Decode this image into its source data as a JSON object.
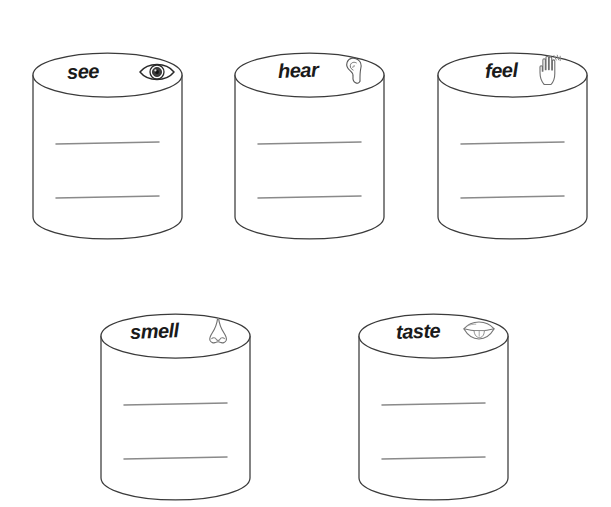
{
  "page": {
    "background_color": "#ffffff",
    "outline_color": "#3a3a3a",
    "writing_line_color": "#8a8a8a",
    "label_color": "#1a1a1a"
  },
  "jars": [
    {
      "id": "see",
      "label": "see",
      "icon": "eye-icon",
      "x": 32,
      "y": 52,
      "width": 151,
      "height": 188,
      "label_x": 35,
      "label_y": 10,
      "icon_x": 106,
      "icon_y": 8,
      "writing_lines": 2
    },
    {
      "id": "hear",
      "label": "hear",
      "icon": "ear-icon",
      "x": 234,
      "y": 52,
      "width": 151,
      "height": 188,
      "label_x": 44,
      "label_y": 9,
      "icon_x": 110,
      "icon_y": 4,
      "writing_lines": 2
    },
    {
      "id": "feel",
      "label": "feel",
      "icon": "hand-icon",
      "x": 437,
      "y": 52,
      "width": 151,
      "height": 188,
      "label_x": 48,
      "label_y": 9,
      "icon_x": 100,
      "icon_y": 2,
      "writing_lines": 2
    },
    {
      "id": "smell",
      "label": "smell",
      "icon": "nose-icon",
      "x": 100,
      "y": 313,
      "width": 151,
      "height": 188,
      "label_x": 30,
      "label_y": 9,
      "icon_x": 105,
      "icon_y": 4,
      "writing_lines": 2
    },
    {
      "id": "taste",
      "label": "taste",
      "icon": "mouth-icon",
      "x": 358,
      "y": 313,
      "width": 151,
      "height": 188,
      "label_x": 38,
      "label_y": 9,
      "icon_x": 104,
      "icon_y": 5,
      "writing_lines": 2
    }
  ]
}
